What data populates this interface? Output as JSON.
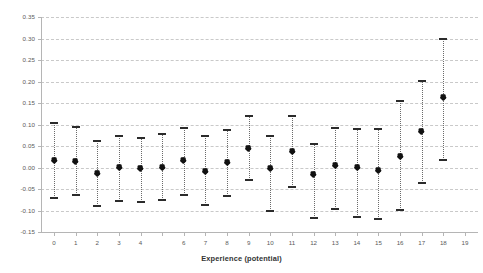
{
  "chart_data": {
    "type": "scatter",
    "title": "",
    "subtitle": "",
    "xlabel": "Experience (potential)",
    "ylabel": "",
    "xlim": [
      -0.6,
      19.6
    ],
    "ylim": [
      -0.15,
      0.35
    ],
    "grid": true,
    "legend": null,
    "marker_color": "#111111",
    "errorbar_color": "#6b6b6b",
    "gridline_color": "#c9c9c9",
    "axis_color": "#b5b5b5",
    "ytick_labels": [
      "0.35",
      "0.30",
      "0.25",
      "0.20",
      "0.15",
      "0.10",
      "0.05",
      "0.00",
      "-0.05",
      "-0.10",
      "-0.15"
    ],
    "ytick_values": [
      0.35,
      0.3,
      0.25,
      0.2,
      0.15,
      0.1,
      0.05,
      0.0,
      -0.05,
      -0.1,
      -0.15
    ],
    "xtick_labels": [
      "0",
      "1",
      "2",
      "3",
      "4",
      "",
      "6",
      "7",
      "8",
      "9",
      "10",
      "11",
      "12",
      "13",
      "14",
      "15",
      "16",
      "17",
      "18",
      "19"
    ],
    "x": [
      0,
      1,
      2,
      3,
      4,
      5,
      6,
      7,
      8,
      9,
      10,
      11,
      12,
      13,
      14,
      15,
      16,
      17,
      18,
      19
    ],
    "values": [
      0.016,
      0.015,
      -0.013,
      0.0,
      -0.002,
      0.001,
      0.016,
      -0.008,
      0.011,
      0.044,
      -0.003,
      0.038,
      -0.015,
      0.004,
      0.0,
      -0.007,
      0.027,
      0.085,
      0.164,
      0.164
    ],
    "ci_lower": [
      -0.072,
      -0.065,
      -0.09,
      -0.077,
      -0.08,
      -0.076,
      -0.063,
      -0.088,
      -0.067,
      -0.03,
      -0.101,
      -0.045,
      -0.118,
      -0.097,
      -0.116,
      -0.119,
      -0.098,
      -0.037,
      0.018,
      0.018
    ],
    "ci_upper": [
      0.104,
      0.095,
      0.062,
      0.074,
      0.069,
      0.078,
      0.091,
      0.073,
      0.087,
      0.12,
      0.074,
      0.12,
      0.055,
      0.092,
      0.089,
      0.089,
      0.155,
      0.201,
      0.3,
      0.3
    ],
    "series": [
      {
        "name": "coefficient estimate",
        "points": [
          {
            "x": 0,
            "value": 0.016,
            "lower": -0.072,
            "upper": 0.104
          },
          {
            "x": 1,
            "value": 0.015,
            "lower": -0.065,
            "upper": 0.095
          },
          {
            "x": 2,
            "value": -0.013,
            "lower": -0.09,
            "upper": 0.062
          },
          {
            "x": 3,
            "value": 0.0,
            "lower": -0.077,
            "upper": 0.074
          },
          {
            "x": 4,
            "value": -0.002,
            "lower": -0.08,
            "upper": 0.069
          },
          {
            "x": 5,
            "value": 0.001,
            "lower": -0.076,
            "upper": 0.078
          },
          {
            "x": 6,
            "value": 0.016,
            "lower": -0.063,
            "upper": 0.091
          },
          {
            "x": 7,
            "value": -0.008,
            "lower": -0.088,
            "upper": 0.073
          },
          {
            "x": 8,
            "value": 0.011,
            "lower": -0.067,
            "upper": 0.087
          },
          {
            "x": 9,
            "value": 0.044,
            "lower": -0.03,
            "upper": 0.12
          },
          {
            "x": 10,
            "value": -0.003,
            "lower": -0.101,
            "upper": 0.074
          },
          {
            "x": 11,
            "value": 0.038,
            "lower": -0.045,
            "upper": 0.12
          },
          {
            "x": 12,
            "value": -0.015,
            "lower": -0.118,
            "upper": 0.055
          },
          {
            "x": 13,
            "value": 0.004,
            "lower": -0.097,
            "upper": 0.092
          },
          {
            "x": 14,
            "value": 0.0,
            "lower": -0.116,
            "upper": 0.089
          },
          {
            "x": 15,
            "value": -0.007,
            "lower": -0.119,
            "upper": 0.089
          },
          {
            "x": 16,
            "value": 0.027,
            "lower": -0.098,
            "upper": 0.155
          },
          {
            "x": 17,
            "value": 0.085,
            "lower": -0.037,
            "upper": 0.201
          },
          {
            "x": 18,
            "value": 0.164,
            "lower": 0.018,
            "upper": 0.3
          }
        ]
      }
    ]
  }
}
